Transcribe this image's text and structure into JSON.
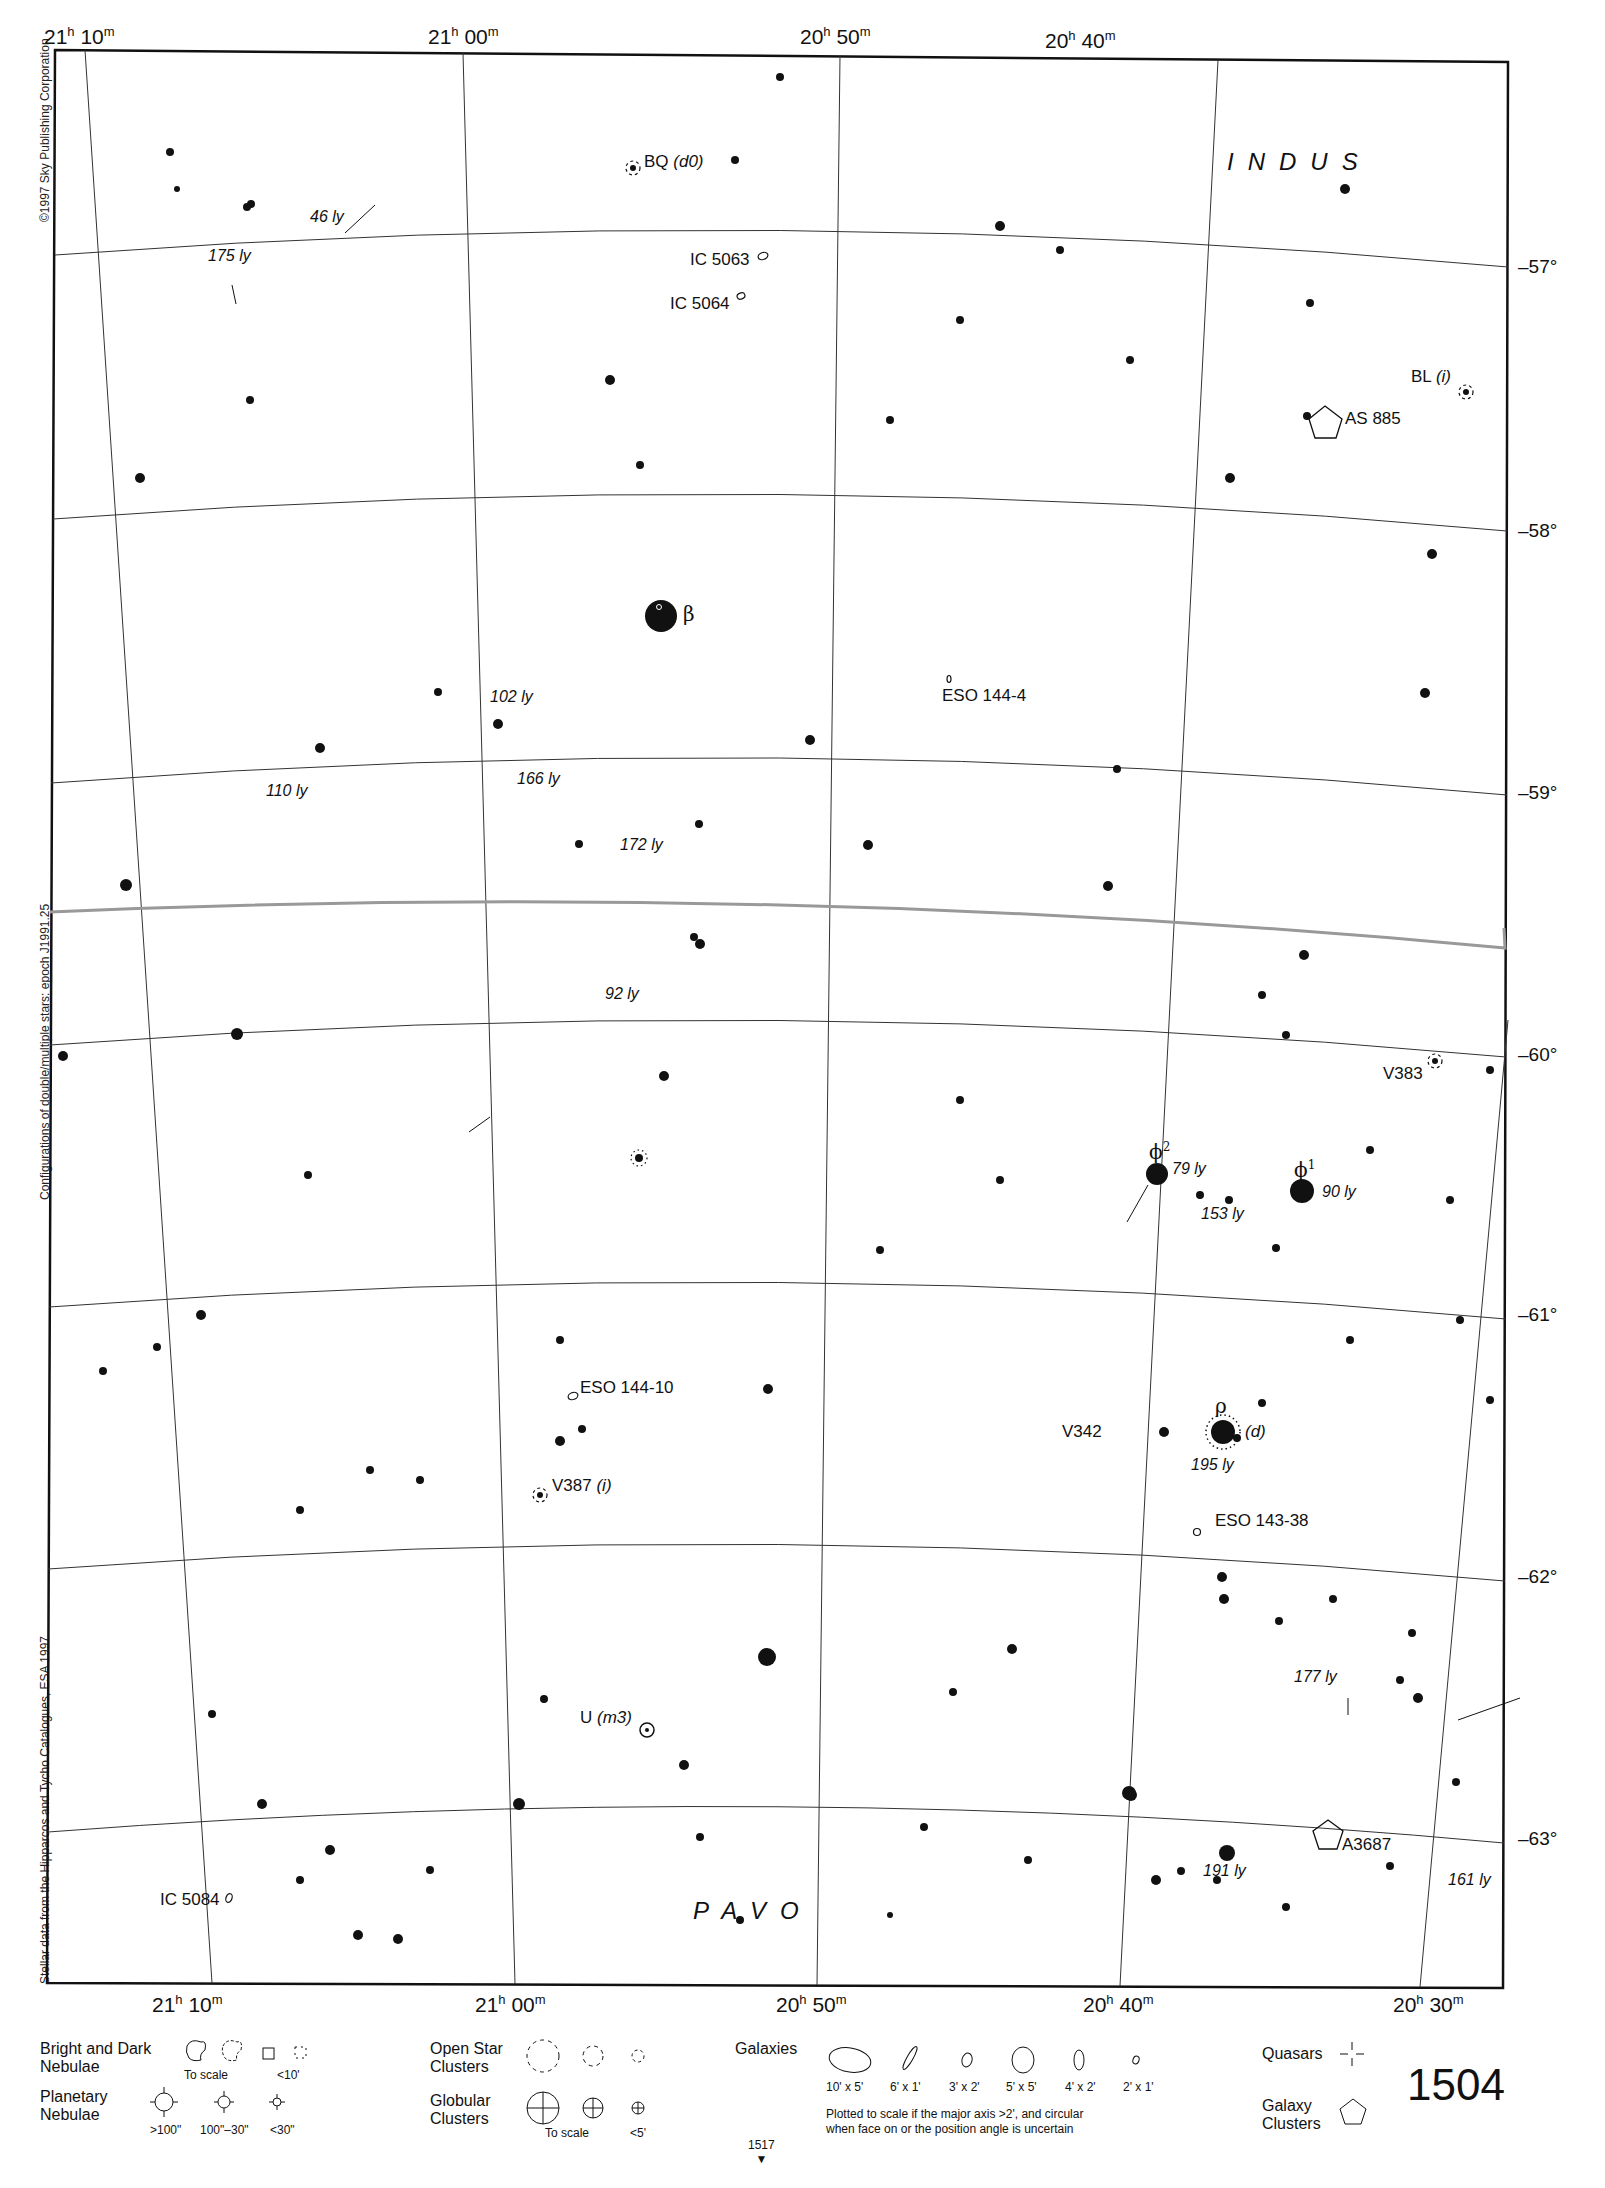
{
  "chart_page": {
    "page_number": "1504",
    "adjacent_chart_below": "1517",
    "adjacent_arrow": "▼"
  },
  "margin_notes": {
    "copyright": "©1997 Sky Publishing Corporation",
    "epoch": "Configurations of double/multiple stars: epoch J1991.25",
    "source": "Stellar data from the Hipparcos and Tycho Catalogues, ESA 1997"
  },
  "axes": {
    "ra_top": [
      "21",
      "10",
      "21",
      "00",
      "20",
      "50",
      "20",
      "40"
    ],
    "ra_top_labels": [
      {
        "h": "21",
        "m": "10"
      },
      {
        "h": "21",
        "m": "00"
      },
      {
        "h": "20",
        "m": "50"
      },
      {
        "h": "20",
        "m": "40"
      }
    ],
    "ra_bottom_labels": [
      {
        "h": "21",
        "m": "10"
      },
      {
        "h": "21",
        "m": "00"
      },
      {
        "h": "20",
        "m": "50"
      },
      {
        "h": "20",
        "m": "40"
      },
      {
        "h": "20",
        "m": "30"
      }
    ],
    "hour_sym": "h",
    "min_sym": "m",
    "dec_labels": [
      "–57°",
      "–58°",
      "–59°",
      "–60°",
      "–61°",
      "–62°",
      "–63°"
    ]
  },
  "constellations": {
    "indus": "INDUS",
    "pavo": "PAVO"
  },
  "objects": {
    "bq": "BQ",
    "bq_note": "(d0)",
    "ic5063": "IC 5063",
    "ic5064": "IC 5064",
    "bl": "BL",
    "bl_note": "(i)",
    "as885": "AS 885",
    "eso144_4": "ESO 144-4",
    "v383": "V383",
    "eso144_10": "ESO 144-10",
    "v387": "V387",
    "v387_note": "(i)",
    "v342": "V342",
    "rho_note": "(d)",
    "eso143_38": "ESO 143-38",
    "u": "U",
    "u_note": "(m3)",
    "a3687": "A3687",
    "ic5084": "IC 5084"
  },
  "greek": {
    "beta": "β",
    "phi2": "ϕ",
    "phi2_sup": "2",
    "phi1": "ϕ",
    "phi1_sup": "1",
    "rho": "ρ"
  },
  "distances": {
    "d46": "46 ly",
    "d175": "175 ly",
    "d102": "102 ly",
    "d110": "110 ly",
    "d166": "166 ly",
    "d172": "172 ly",
    "d92": "92 ly",
    "d79": "79 ly",
    "d90": "90 ly",
    "d153": "153 ly",
    "d195": "195 ly",
    "d177": "177 ly",
    "d191": "191 ly",
    "d161": "161 ly"
  },
  "legend": {
    "nebulae_title": "Bright and Dark\nNebulae",
    "nebulae_title_1": "Bright and Dark",
    "nebulae_title_2": "Nebulae",
    "nebulae_scale": "To scale",
    "nebulae_small": "<10'",
    "planetary_title_1": "Planetary",
    "planetary_title_2": "Nebulae",
    "planetary_sizes": [
      ">100\"",
      "100\"–30\"",
      "<30\""
    ],
    "open_title_1": "Open Star",
    "open_title_2": "Clusters",
    "globular_title_1": "Globular",
    "globular_title_2": "Clusters",
    "globular_scale": "To scale",
    "globular_small": "<5'",
    "galaxies_title": "Galaxies",
    "galaxy_sizes": [
      "10' x 5'",
      "6' x 1'",
      "3' x 2'",
      "5' x 5'",
      "4' x 2'",
      "2' x 1'"
    ],
    "galaxy_note_1": "Plotted to scale if the major axis >2', and circular",
    "galaxy_note_2": "when face on or the position angle is uncertain",
    "quasars_title": "Quasars",
    "galaxy_clusters_title_1": "Galaxy",
    "galaxy_clusters_title_2": "Clusters"
  }
}
